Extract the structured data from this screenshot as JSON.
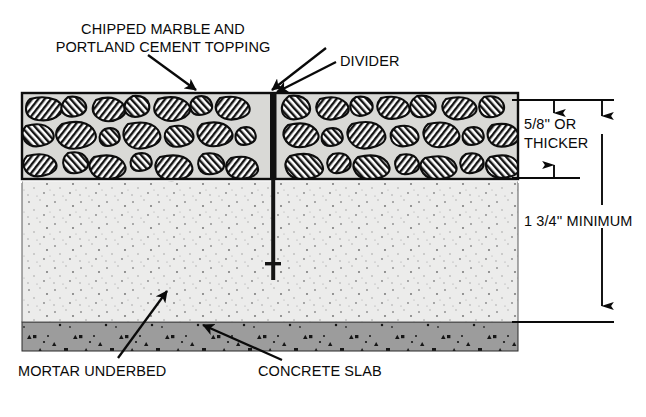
{
  "diagram": {
    "labels": {
      "topping_line1": "CHIPPED MARBLE AND",
      "topping_line2": "PORTLAND CEMENT TOPPING",
      "divider": "DIVIDER",
      "dim_topping_line1": "5/8'' OR",
      "dim_topping_line2": "THICKER",
      "dim_total": "1 3/4'' MINIMUM",
      "mortar": "MORTAR UNDERBED",
      "concrete": "CONCRETE SLAB"
    },
    "colors": {
      "ink": "#0a0a0a",
      "topping_matrix": "#d9d9d6",
      "topping_chip": "#ffffff",
      "mortar": "#ededeb",
      "concrete": "#9a9a9a",
      "divider": "#101010",
      "background": "#ffffff"
    },
    "layers": [
      {
        "name": "topping",
        "label": "CHIPPED MARBLE AND PORTLAND CEMENT TOPPING",
        "thickness": "5/8'' OR THICKER"
      },
      {
        "name": "mortar",
        "label": "MORTAR UNDERBED",
        "thickness": ""
      },
      {
        "name": "concrete",
        "label": "CONCRETE SLAB",
        "thickness": ""
      }
    ],
    "dimensions": [
      {
        "name": "topping-thickness",
        "value": "5/8'' OR THICKER"
      },
      {
        "name": "total-thickness",
        "value": "1 3/4'' MINIMUM"
      }
    ]
  }
}
